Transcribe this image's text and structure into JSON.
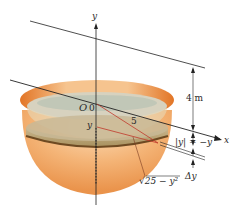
{
  "diagram": {
    "type": "hemispherical tank with horizontal slab slice",
    "labels": {
      "y_axis": "y",
      "x_axis": "x",
      "origin": "O",
      "origin_zero": "0",
      "slice_depth_y": "y",
      "radius": "5",
      "height": "4 m",
      "abs_y": "|y| = −y",
      "delta_y": "Δy",
      "slice_radius": "√25 − y²"
    },
    "colors": {
      "bowl_outer": "#f0a45c",
      "bowl_rim": "#e07a2e",
      "liquid_top": "#b9c2b0",
      "slab": "#b59a6a",
      "slab_edge": "#7a5326",
      "axis": "#222222",
      "red_lines": "#c0392b"
    }
  }
}
